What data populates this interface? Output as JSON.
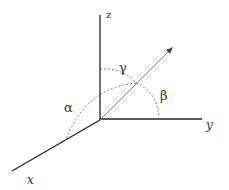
{
  "diagram": {
    "axes": {
      "x": "x",
      "y": "y",
      "z": "z"
    },
    "angles": {
      "alpha": "α",
      "beta": "β",
      "gamma": "γ"
    },
    "colors": {
      "axis": "#222222",
      "vector": "#888888",
      "arc": "#555555"
    }
  }
}
